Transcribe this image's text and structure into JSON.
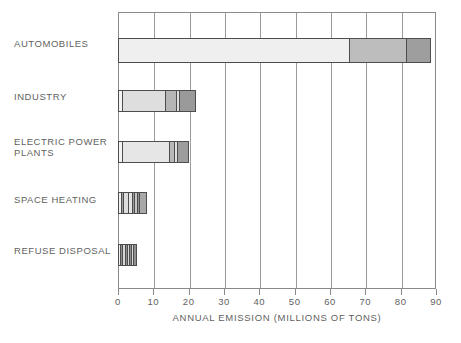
{
  "chart_data": {
    "type": "bar",
    "orientation": "horizontal",
    "title": "",
    "xlabel": "ANNUAL EMISSION (MILLIONS OF TONS)",
    "ylabel": "",
    "xlim": [
      0,
      90
    ],
    "xticks": [
      0,
      10,
      20,
      30,
      40,
      50,
      60,
      70,
      80,
      90
    ],
    "xtick_labels": [
      "0",
      "10",
      "20",
      "30",
      "40",
      "50",
      "60",
      "70",
      "80",
      "90"
    ],
    "grid": true,
    "grid_axis": "x",
    "legend": "none",
    "categories": [
      "AUTOMOBILES",
      "INDUSTRY",
      "ELECTRIC POWER PLANTS",
      "SPACE HEATING",
      "REFUSE DISPOSAL"
    ],
    "stacked": true,
    "bars": [
      {
        "category": "AUTOMOBILES",
        "total": 88.5,
        "segments": [
          {
            "value": 65.7,
            "color": "#efefef"
          },
          {
            "value": 16.3,
            "color": "#bdbdbd"
          },
          {
            "value": 6.5,
            "color": "#9e9e9e"
          }
        ]
      },
      {
        "category": "INDUSTRY",
        "total": 22.0,
        "segments": [
          {
            "value": 1.3,
            "color": "#f4f4f4"
          },
          {
            "value": 12.5,
            "color": "#dedede"
          },
          {
            "value": 3.0,
            "color": "#b5b5b5"
          },
          {
            "value": 0.8,
            "color": "#dedede"
          },
          {
            "value": 4.4,
            "color": "#9a9a9a"
          }
        ]
      },
      {
        "category": "ELECTRIC POWER PLANTS",
        "total": 20.0,
        "segments": [
          {
            "value": 1.1,
            "color": "#f4f4f4"
          },
          {
            "value": 13.9,
            "color": "#e6e6e6"
          },
          {
            "value": 1.4,
            "color": "#b8b8b8"
          },
          {
            "value": 0.8,
            "color": "#e0e0e0"
          },
          {
            "value": 2.8,
            "color": "#9c9c9c"
          }
        ]
      },
      {
        "category": "SPACE HEATING",
        "total": 8.2,
        "segments": [
          {
            "value": 1.0,
            "color": "#f2f2f2"
          },
          {
            "value": 0.4,
            "color": "#9c9c9c"
          },
          {
            "value": 1.6,
            "color": "#dcdcdc"
          },
          {
            "value": 1.4,
            "color": "#e4e4e4"
          },
          {
            "value": 0.5,
            "color": "#9a9a9a"
          },
          {
            "value": 1.0,
            "color": "#c6c6c6"
          },
          {
            "value": 0.5,
            "color": "#8f8f8f"
          },
          {
            "value": 1.8,
            "color": "#a8a8a8"
          }
        ]
      },
      {
        "category": "REFUSE DISPOSAL",
        "total": 5.5,
        "segments": [
          {
            "value": 0.7,
            "color": "#f2f2f2"
          },
          {
            "value": 0.7,
            "color": "#8f8f8f"
          },
          {
            "value": 0.7,
            "color": "#d8d8d8"
          },
          {
            "value": 0.7,
            "color": "#8f8f8f"
          },
          {
            "value": 0.7,
            "color": "#d8d8d8"
          },
          {
            "value": 0.7,
            "color": "#8f8f8f"
          },
          {
            "value": 0.7,
            "color": "#d8d8d8"
          },
          {
            "value": 0.6,
            "color": "#8f8f8f"
          }
        ]
      }
    ]
  },
  "axis": {
    "title": "ANNUAL EMISSION (MILLIONS OF TONS)",
    "ticks": [
      "0",
      "10",
      "20",
      "30",
      "40",
      "50",
      "60",
      "70",
      "80",
      "90"
    ]
  },
  "labels": {
    "automobiles": "AUTOMOBILES",
    "industry": "INDUSTRY",
    "electric_power_plants_line1": "ELECTRIC POWER",
    "electric_power_plants_line2": "PLANTS",
    "space_heating": "SPACE HEATING",
    "refuse_disposal": "REFUSE DISPOSAL"
  },
  "credit": "",
  "colors": {
    "frame": "#8a8a8a",
    "grid": "#9a9a9a",
    "bar_outline": "#4d4d4d",
    "text": "#5f5f5f",
    "background": "#ffffff"
  }
}
